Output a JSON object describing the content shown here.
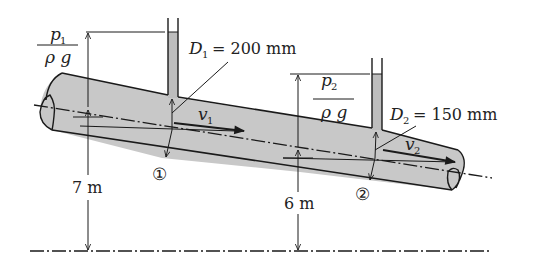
{
  "diagram": {
    "type": "fluid-mechanics inclined pipe with piezometers",
    "colors": {
      "line": "#1a1a1a",
      "pipe_fill": "#c8c8c8",
      "water_fill": "#bdbdbd",
      "background": "#ffffff"
    },
    "section1": {
      "marker": "①",
      "diameter_label": "D",
      "diameter_sub": "1",
      "diameter_value": "= 200 mm",
      "velocity_label": "v",
      "velocity_sub": "1",
      "pressure_head_num": "p",
      "pressure_head_num_sub": "1",
      "pressure_head_den": "ρ g",
      "elevation": "7 m"
    },
    "section2": {
      "marker": "②",
      "diameter_label": "D",
      "diameter_sub": "2",
      "diameter_value": "= 150 mm",
      "velocity_label": "v",
      "velocity_sub": "2",
      "pressure_head_num": "p",
      "pressure_head_num_sub": "2",
      "pressure_head_den": "ρ g",
      "elevation": "6 m"
    }
  }
}
